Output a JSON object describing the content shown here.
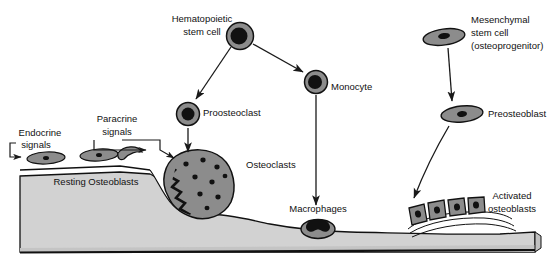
{
  "figure": {
    "background_color": "#ffffff",
    "width": 555,
    "height": 268
  },
  "colors": {
    "bone_matrix": "#d2d2d2",
    "bone_matrix_dark": "#c2c2c2",
    "cell_fill": "#8c8c8c",
    "cell_fill_light": "#9a9a9a",
    "nucleus": "#111111",
    "outline": "#111111",
    "arrow": "#1a1a1a",
    "label_text": "#111111"
  },
  "labels": {
    "hematopoietic_stem_cell_line1": "Hematopoietic",
    "hematopoietic_stem_cell_line2": "stem cell",
    "proosteoclast": "Proosteoclast",
    "monocyte": "Monocyte",
    "osteoclasts": "Osteoclasts",
    "macrophages": "Macrophages",
    "endocrine_signals_line1": "Endocrine",
    "endocrine_signals_line2": "signals",
    "paracrine_signals_line1": "Paracrine",
    "paracrine_signals_line2": "signals",
    "resting_osteoblasts": "Resting Osteoblasts",
    "mesenchymal_stem_cell_line1": "Mesenchymal",
    "mesenchymal_stem_cell_line2": "stem cell",
    "mesenchymal_stem_cell_line3": "(osteoprogenitor)",
    "preosteoblast": "Preosteoblast",
    "activated_osteoblasts_line1": "Activated",
    "activated_osteoblasts_line2": "osteoblasts"
  },
  "cells": {
    "hematopoietic_stem_cell": {
      "shape": "round",
      "cx": 240,
      "cy": 36,
      "r": 13,
      "nucleus_r": 8
    },
    "proosteoclast": {
      "shape": "round",
      "cx": 188,
      "cy": 114,
      "r": 11,
      "nucleus_r": 6
    },
    "monocyte": {
      "shape": "round",
      "cx": 315,
      "cy": 82,
      "r": 11,
      "nucleus_r": 6.5
    },
    "macrophage": {
      "shape": "oval-kidney",
      "cx": 318,
      "cy": 230,
      "rx": 16,
      "ry": 9
    },
    "osteoclast": {
      "shape": "large-multinucleated",
      "cx": 198,
      "cy": 183,
      "nuclei_count": 9
    },
    "mesenchymal_stem_cell": {
      "shape": "flat-lens",
      "cx": 444,
      "cy": 37,
      "rx": 20,
      "ry": 7
    },
    "preosteoblast": {
      "shape": "flat-lens",
      "cx": 462,
      "cy": 114,
      "rx": 20,
      "ry": 7
    },
    "resting_osteoblasts": [
      {
        "cx": 46,
        "cy": 158,
        "rx": 18,
        "ry": 6
      },
      {
        "cx": 98,
        "cy": 156,
        "rx": 18,
        "ry": 6
      },
      {
        "cx": 130,
        "cy": 155,
        "shape": "crescent"
      }
    ],
    "activated_osteoblasts_count": 4
  },
  "arrows": [
    {
      "name": "hsc-to-proosteoclast",
      "from": "hematopoietic_stem_cell",
      "to": "proosteoclast"
    },
    {
      "name": "hsc-to-monocyte",
      "from": "hematopoietic_stem_cell",
      "to": "monocyte"
    },
    {
      "name": "proosteoclast-to-osteoclast",
      "from": "proosteoclast",
      "to": "osteoclast"
    },
    {
      "name": "monocyte-to-macrophage",
      "from": "monocyte",
      "to": "macrophage"
    },
    {
      "name": "mesenchymal-to-preosteoblast",
      "from": "mesenchymal_stem_cell",
      "to": "preosteoblast"
    },
    {
      "name": "preosteoblast-to-activated-osteoblasts",
      "from": "preosteoblast",
      "to": "activated_osteoblasts",
      "style": "curved"
    },
    {
      "name": "endocrine-signal-arrow",
      "from": "endocrine_signals",
      "to": "resting_osteoblasts"
    },
    {
      "name": "paracrine-signal-arrow-1",
      "from": "paracrine_signals",
      "to": "resting_osteoblast-3"
    },
    {
      "name": "paracrine-signal-arrow-2",
      "from": "paracrine_signals",
      "to": "osteoclast"
    }
  ]
}
